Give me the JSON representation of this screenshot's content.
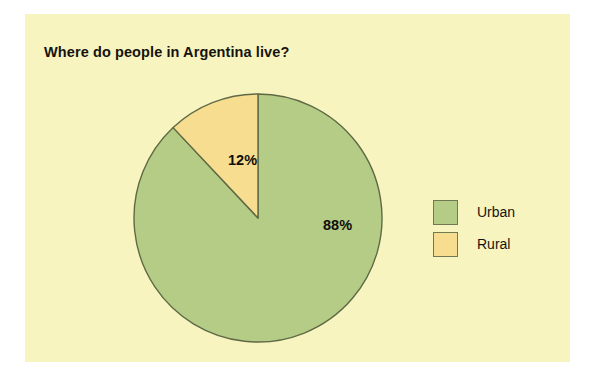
{
  "card": {
    "background_color": "#f8f4c0"
  },
  "chart_data": {
    "type": "pie",
    "title": "Where do people in Argentina live?",
    "categories": [
      "Urban",
      "Rural"
    ],
    "values": [
      88,
      12
    ],
    "value_labels": [
      "88%",
      "12%"
    ],
    "colors": [
      "#b5cc86",
      "#f7dd90"
    ],
    "slice_outline_color": "#5f6a45",
    "start_angle_deg": 0,
    "direction": "counterclockwise",
    "legend_position": "right",
    "grid": false,
    "xlabel": "",
    "ylabel": "",
    "slices": [
      {
        "name": "Urban",
        "value": 88,
        "label": "88%",
        "color": "#b5cc86"
      },
      {
        "name": "Rural",
        "value": 12,
        "label": "12%",
        "color": "#f7dd90"
      }
    ]
  },
  "legend": {
    "items": [
      {
        "label": "Urban",
        "color": "#b5cc86"
      },
      {
        "label": "Rural",
        "color": "#f7dd90"
      }
    ]
  }
}
